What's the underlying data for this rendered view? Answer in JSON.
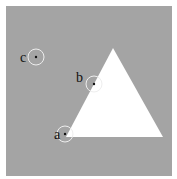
{
  "colors": {
    "background": "#ffffff",
    "panel": "#a4a4a4",
    "shape": "#ffffff",
    "circle_stroke": "#eeeeee",
    "dot": "#111111"
  },
  "triangle": {
    "points": "113,48 66,137 163,137"
  },
  "markers": [
    {
      "label": "a",
      "cx": 65,
      "cy": 134,
      "r": 8,
      "lx": 54,
      "ly": 139
    },
    {
      "label": "b",
      "cx": 94,
      "cy": 84,
      "r": 8,
      "lx": 76,
      "ly": 82
    },
    {
      "label": "c",
      "cx": 36,
      "cy": 57,
      "r": 8,
      "lx": 20,
      "ly": 62
    }
  ]
}
